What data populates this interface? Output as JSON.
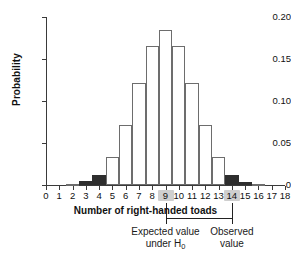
{
  "chart_data": {
    "type": "bar",
    "title": "",
    "xlabel": "Number of right-handed toads",
    "ylabel": "Probability",
    "categories": [
      0,
      1,
      2,
      3,
      4,
      5,
      6,
      7,
      8,
      9,
      10,
      11,
      12,
      13,
      14,
      15,
      16,
      17,
      18
    ],
    "values": [
      0.0,
      0.0,
      0.001,
      0.005,
      0.012,
      0.033,
      0.071,
      0.121,
      0.166,
      0.185,
      0.166,
      0.121,
      0.071,
      0.033,
      0.012,
      0.004,
      0.001,
      0.0,
      0.0
    ],
    "bar_styles": [
      "open",
      "open",
      "open",
      "solid",
      "solid",
      "open",
      "open",
      "open",
      "open",
      "open",
      "open",
      "open",
      "open",
      "open",
      "solid",
      "solid",
      "open",
      "open",
      "open"
    ],
    "xlim": [
      0,
      18
    ],
    "ylim": [
      0,
      0.2
    ],
    "ytick_values": [
      0,
      0.05,
      0.1,
      0.15,
      0.2
    ],
    "ytick_labels": [
      "0",
      "0.05",
      "0.10",
      "0.15",
      "0.20"
    ],
    "xtick_labels": [
      "0",
      "1",
      "2",
      "3",
      "4",
      "5",
      "6",
      "7",
      "8",
      "9",
      "10",
      "11",
      "12",
      "13",
      "14",
      "15",
      "16",
      "17",
      "18"
    ],
    "highlighted_xticks": [
      "9",
      "14"
    ],
    "grid": false,
    "legend": false,
    "annotations": [
      {
        "name": "expected-value",
        "text_line1": "Expected value",
        "text_line2": "under H",
        "subscript": "0",
        "points_to": "9"
      },
      {
        "name": "observed-value",
        "text_line1": "Observed",
        "text_line2": "value",
        "subscript": "",
        "points_to": "14"
      }
    ],
    "colors": {
      "bar_fill_open": "#ffffff",
      "bar_stroke_open": "#6d6d6d",
      "bar_fill_solid": "#2e2e2e",
      "axis": "#3a3a3a",
      "highlight": "#cfcfcf",
      "text": "#111111"
    }
  }
}
